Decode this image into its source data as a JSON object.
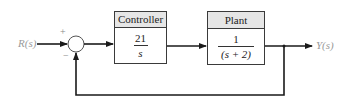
{
  "diagram": {
    "type": "feedback-block-diagram",
    "input_signal": "R(s)",
    "output_signal": "Y(s)",
    "summing_junction": {
      "plus_sign": "+",
      "minus_sign": "−"
    },
    "blocks": [
      {
        "id": "controller",
        "title": "Controller",
        "numerator": "21",
        "denominator": "s"
      },
      {
        "id": "plant",
        "title": "Plant",
        "numerator": "1",
        "denominator": "(s + 2)"
      }
    ],
    "feedback": "unity negative feedback",
    "colors": {
      "line": "#1a1a1a",
      "header_fill": "#e6e6e6",
      "label": "#9a9a9a"
    }
  }
}
